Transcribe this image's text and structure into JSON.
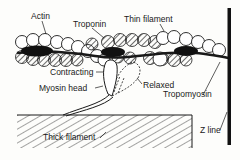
{
  "diagram": {
    "labels": {
      "actin": "Actin",
      "troponin": "Troponin",
      "thin_filament": "Thin filament",
      "contracting": "Contracting",
      "relaxed": "Relaxed",
      "myosin_head": "Myosin head",
      "tropomyosin": "Tropomyosin",
      "thick_filament": "Thick filament",
      "z_line": "Z line"
    },
    "colors": {
      "ink": "#1a1a1a",
      "background": "#fdfdfb"
    }
  }
}
